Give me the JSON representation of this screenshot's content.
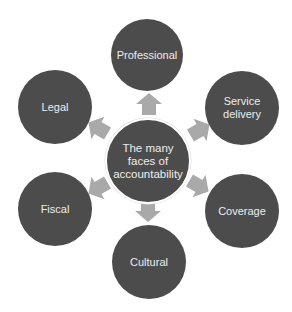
{
  "diagram": {
    "title": "The many faces of accountability",
    "colors": {
      "node_fill": "#4c4c4c",
      "arrow_fill": "#a9a9a9",
      "text": "#ececec",
      "background": "#ffffff"
    },
    "center": {
      "label": "The many\nfaces of\naccountability",
      "cx": 148,
      "cy": 161,
      "r": 43
    },
    "nodes": [
      {
        "id": "professional",
        "label": "Professional",
        "cx": 147,
        "cy": 55,
        "r": 36
      },
      {
        "id": "service-delivery",
        "label": "Service\ndelivery",
        "cx": 242,
        "cy": 108,
        "r": 37
      },
      {
        "id": "coverage",
        "label": "Coverage",
        "cx": 242,
        "cy": 211,
        "r": 37
      },
      {
        "id": "cultural",
        "label": "Cultural",
        "cx": 149,
        "cy": 262,
        "r": 37
      },
      {
        "id": "fiscal",
        "label": "Fiscal",
        "cx": 55,
        "cy": 209,
        "r": 37
      },
      {
        "id": "legal",
        "label": "Legal",
        "cx": 55,
        "cy": 107,
        "r": 37
      }
    ],
    "arrows": [
      {
        "to": "professional",
        "cx": 149,
        "cy": 104,
        "angle": 0
      },
      {
        "to": "service-delivery",
        "cx": 200,
        "cy": 130,
        "angle": 60
      },
      {
        "to": "coverage",
        "cx": 199,
        "cy": 186,
        "angle": 120
      },
      {
        "to": "cultural",
        "cx": 148,
        "cy": 211,
        "angle": 180
      },
      {
        "to": "fiscal",
        "cx": 98,
        "cy": 188,
        "angle": 240
      },
      {
        "to": "legal",
        "cx": 98,
        "cy": 128,
        "angle": 300
      }
    ]
  }
}
